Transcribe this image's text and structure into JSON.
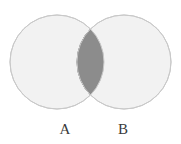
{
  "figure": {
    "name": "venn-diagram-two-sets",
    "width": 181,
    "height": 144,
    "background_color": "#ffffff"
  },
  "chart_data": {
    "type": "diagram",
    "diagram_type": "venn",
    "title": "",
    "set_count": 2,
    "background": "#ffffff",
    "sets": [
      {
        "id": "A",
        "label": "A",
        "center_x": 57,
        "center_y": 62,
        "radius": 47,
        "fill": "#f2f2f2",
        "stroke": "#c9c9c9",
        "stroke_width": 1,
        "label_x": 65,
        "label_y": 134
      },
      {
        "id": "B",
        "label": "B",
        "center_x": 124,
        "center_y": 62,
        "radius": 47,
        "fill": "#f2f2f2",
        "stroke": "#c9c9c9",
        "stroke_width": 1,
        "label_x": 123,
        "label_y": 134
      }
    ],
    "regions": [
      {
        "id": "A-only",
        "label": "",
        "fill": "#f2f2f2",
        "shaded": false
      },
      {
        "id": "B-only",
        "label": "",
        "fill": "#f2f2f2",
        "shaded": false
      },
      {
        "id": "A-intersect-B",
        "label": "",
        "fill": "#8c8c8c",
        "stroke": "#6e6e6e",
        "shaded": true,
        "lens_left_x": 68,
        "lens_right_x": 115,
        "lens_top_y": 16,
        "lens_bottom_y": 108,
        "lens_center_x": 91
      }
    ],
    "annotations": [],
    "legend": {
      "visible": false,
      "position": "none"
    },
    "labels": {
      "A": "A",
      "B": "B"
    }
  }
}
